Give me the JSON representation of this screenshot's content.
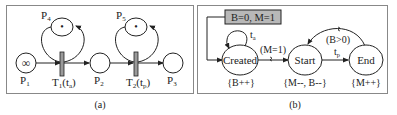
{
  "panel_a": {
    "caption": "(a)",
    "places": [
      {
        "id": "P1",
        "label": "P",
        "sub": "1",
        "token": "∞"
      },
      {
        "id": "P2",
        "label": "P",
        "sub": "2",
        "token": ""
      },
      {
        "id": "P3",
        "label": "P",
        "sub": "3",
        "token": ""
      },
      {
        "id": "P4",
        "label": "P",
        "sub": "4",
        "token": "•"
      },
      {
        "id": "P5",
        "label": "P",
        "sub": "5",
        "token": "•"
      }
    ],
    "transitions": [
      {
        "id": "T1",
        "label": "T",
        "sub": "1",
        "param": "(t",
        "param_sub": "a",
        "close": ")"
      },
      {
        "id": "T2",
        "label": "T",
        "sub": "2",
        "param": "(t",
        "param_sub": "p",
        "close": ")"
      }
    ]
  },
  "panel_b": {
    "caption": "(b)",
    "init_box": "B=0, M=1",
    "states": [
      {
        "id": "created",
        "label": "Created",
        "action": "{B++}"
      },
      {
        "id": "start",
        "label": "Start",
        "action": "{M--, B--}"
      },
      {
        "id": "end",
        "label": "End",
        "action": "{M++}"
      }
    ],
    "edges": {
      "self_loop": {
        "label": "t",
        "sub": "a"
      },
      "created_to_start": {
        "label": "(M=1)"
      },
      "start_to_end": {
        "label": "t",
        "sub": "p"
      },
      "end_to_start": {
        "label": "(B>0)"
      }
    }
  },
  "colors": {
    "stroke": "#222222",
    "frame": "#888888",
    "init_box_fill": "#b8b8b8",
    "transition_fill": "#9a9a9a"
  }
}
